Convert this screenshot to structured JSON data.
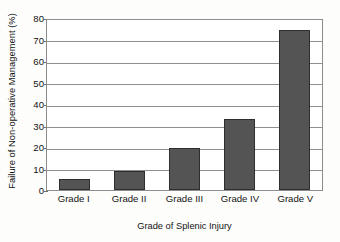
{
  "chart_data": {
    "type": "bar",
    "title": "",
    "subtitle": "",
    "xlabel": "Grade of Splenic Injury",
    "ylabel": "Failure of Non-operative Management (%)",
    "categories": [
      "Grade I",
      "Grade II",
      "Grade III",
      "Grade IV",
      "Grade V"
    ],
    "values": [
      5,
      9,
      19.5,
      33,
      74.5
    ],
    "ylim": [
      0,
      80
    ],
    "ytick_labels": [
      "0",
      "10",
      "20",
      "30",
      "40",
      "50",
      "60",
      "70",
      "80"
    ],
    "ytick_values": [
      0,
      10,
      20,
      30,
      40,
      50,
      60,
      70,
      80
    ],
    "grid": "horizontal",
    "legend": "none",
    "series": [
      {
        "name": "Failure of Non-operative Management",
        "values": [
          5,
          9,
          19.5,
          33,
          74.5
        ]
      }
    ],
    "annotations": []
  },
  "style": {
    "bar_fill": "#545454",
    "bar_stroke": "#2e2e2e",
    "grid_color": "#8f8f8f",
    "frame_color": "#8d8d8d",
    "text_color": "#131313",
    "background": "#fdfdfc"
  }
}
